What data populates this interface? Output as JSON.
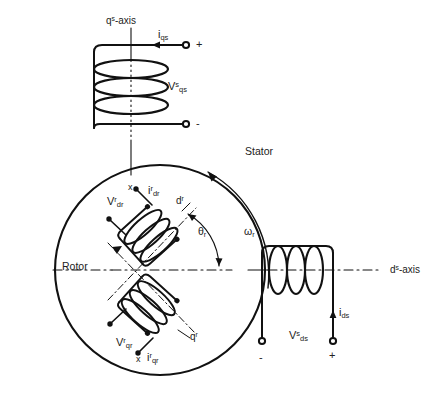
{
  "figure": {
    "title_fragment": "",
    "stroke_color": "#111111",
    "label_color": "#222222",
    "background": "#ffffff"
  },
  "labels": {
    "qs_axis": "q",
    "qs_axis_sup": "s",
    "qs_axis_tail": "-axis",
    "ds_axis": "d",
    "ds_axis_sup": "s",
    "ds_axis_tail": "-axis",
    "stator": "Stator",
    "rotor": "Rotor",
    "omega_r": "ω",
    "omega_r_sub": "r",
    "theta_r": "θ",
    "theta_r_sub": "r",
    "dr_axis": "d",
    "dr_axis_sup": "r",
    "qr_axis": "q",
    "qr_axis_sup": "r"
  },
  "stator_q_winding": {
    "current": "i",
    "current_sub": "qs",
    "voltage": "V",
    "voltage_sup": "s",
    "voltage_sub": "qs",
    "terminal_plus": "+",
    "terminal_minus": "-"
  },
  "stator_d_winding": {
    "current": "i",
    "current_sub": "ds",
    "voltage": "V",
    "voltage_sup": "s",
    "voltage_sub": "ds",
    "terminal_plus": "+",
    "terminal_minus": "-"
  },
  "rotor_d_winding": {
    "current": "i",
    "current_sup": "r",
    "current_sub": "dr",
    "voltage": "V",
    "voltage_sup": "r",
    "voltage_sub": "dr",
    "polarity_mark": "x"
  },
  "rotor_q_winding": {
    "current": "i",
    "current_sup": "r",
    "current_sub": "qr",
    "voltage": "V",
    "voltage_sup": "r",
    "voltage_sub": "qr",
    "polarity_mark": "x"
  }
}
